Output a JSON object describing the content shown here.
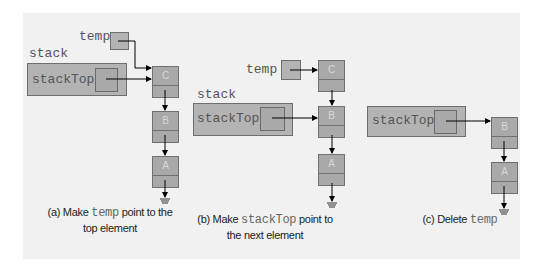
{
  "figure": {
    "panels": [
      {
        "id": "a",
        "labels": {
          "stack": "stack",
          "stackTop": "stackTop",
          "temp": "temp"
        },
        "nodes": [
          "C",
          "B",
          "A"
        ],
        "caption": {
          "prefix": "(a) Make ",
          "code": "temp",
          "suffix": " point to the",
          "line2": "top element"
        }
      },
      {
        "id": "b",
        "labels": {
          "stack": "stack",
          "stackTop": "stackTop",
          "temp": "temp"
        },
        "nodes": [
          "C",
          "B",
          "A"
        ],
        "caption": {
          "prefix": "(b) Make ",
          "code": "stackTop",
          "suffix": " point to",
          "line2": "the next element"
        }
      },
      {
        "id": "c",
        "labels": {
          "stackTop": "stackTop"
        },
        "nodes": [
          "B",
          "A"
        ],
        "caption": {
          "prefix": "(c) Delete ",
          "code": "temp",
          "suffix": "",
          "line2": ""
        }
      }
    ],
    "colors": {
      "panel_bg": "#f1f1f1",
      "box_fill": "#b3b3b3",
      "border": "#6e6e6e",
      "arrow": "#000000",
      "label_text": "#555555"
    }
  }
}
